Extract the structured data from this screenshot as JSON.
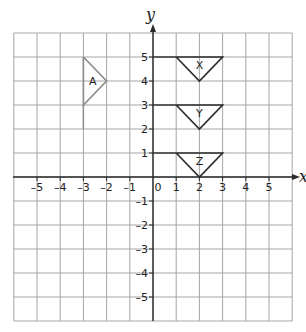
{
  "diagram": {
    "type": "coordinate-grid",
    "axes": {
      "x_label": "x",
      "y_label": "y",
      "x_ticks": [
        "-5",
        "-4",
        "-3",
        "-2",
        "-1",
        "0",
        "1",
        "2",
        "3",
        "4",
        "5"
      ],
      "y_ticks": [
        "5",
        "4",
        "3",
        "2",
        "1",
        "-1",
        "-2",
        "-3",
        "-4",
        "-5"
      ],
      "x_range": [
        -6,
        6
      ],
      "y_range": [
        -6,
        6
      ],
      "origin_label": "0"
    },
    "shapes": [
      {
        "label": "A",
        "color": "#8a8a8a",
        "points": [
          [
            -3,
            5
          ],
          [
            -2,
            4
          ],
          [
            -3,
            3
          ]
        ],
        "extra_segment": [
          [
            -3,
            3
          ],
          [
            -3,
            2
          ]
        ]
      },
      {
        "label": "X",
        "color": "#2a2a2a",
        "points": [
          [
            1,
            5
          ],
          [
            3,
            5
          ],
          [
            2,
            4
          ]
        ]
      },
      {
        "label": "Y",
        "color": "#2a2a2a",
        "points": [
          [
            1,
            3
          ],
          [
            3,
            3
          ],
          [
            2,
            2
          ]
        ]
      },
      {
        "label": "Z",
        "color": "#2a2a2a",
        "points": [
          [
            1,
            1
          ],
          [
            3,
            1
          ],
          [
            2,
            0
          ]
        ]
      }
    ],
    "leader_lines": [
      {
        "from": [
          0,
          5
        ],
        "to": [
          1,
          5
        ]
      },
      {
        "from": [
          0,
          3
        ],
        "to": [
          1,
          3
        ]
      },
      {
        "from": [
          0,
          1
        ],
        "to": [
          1,
          1
        ]
      }
    ],
    "colors": {
      "grid": "#a6a6a6",
      "axis": "#2a2a2a",
      "shape_A": "#8a8a8a",
      "shape_XYZ": "#2a2a2a"
    }
  }
}
